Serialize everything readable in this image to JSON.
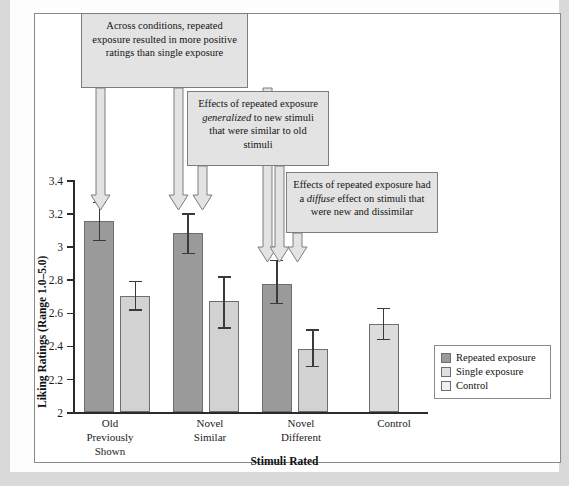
{
  "chart_data": {
    "type": "bar",
    "title": "",
    "xlabel": "Stimuli Rated",
    "ylabel": "Liking Ratings (Range 1.0–5.0)",
    "ylim": [
      2,
      3.4
    ],
    "yticks": [
      "2",
      "2.2",
      "2.4",
      "2.6",
      "2.8",
      "3",
      "3.2",
      "3.4"
    ],
    "ytick_values": [
      2,
      2.2,
      2.4,
      2.6,
      2.8,
      3.0,
      3.2,
      3.4
    ],
    "grid": false,
    "legend_position": "bottom-right",
    "categories": [
      "Old Previously Shown",
      "Novel Similar",
      "Novel Different",
      "Control"
    ],
    "category_lines": [
      [
        "Old",
        "Previously",
        "Shown"
      ],
      [
        "Novel",
        "Similar"
      ],
      [
        "Novel",
        "Different"
      ],
      [
        "Control"
      ]
    ],
    "series": [
      {
        "name": "Repeated exposure",
        "color": "#9a9a9a",
        "values": [
          3.15,
          3.08,
          2.77,
          null
        ],
        "err_low": [
          3.04,
          2.96,
          2.66,
          null
        ],
        "err_high": [
          3.27,
          3.2,
          2.92,
          null
        ]
      },
      {
        "name": "Single exposure",
        "color": "#d2d2d2",
        "values": [
          2.7,
          2.67,
          2.38,
          null
        ],
        "err_low": [
          2.62,
          2.51,
          2.28,
          null
        ],
        "err_high": [
          2.79,
          2.82,
          2.5,
          null
        ]
      },
      {
        "name": "Control",
        "color": "#dcdcdc",
        "values": [
          null,
          null,
          null,
          2.53
        ],
        "err_low": [
          null,
          null,
          null,
          2.44
        ],
        "err_high": [
          null,
          null,
          null,
          2.63
        ]
      }
    ]
  },
  "legend": {
    "items": [
      {
        "label": "Repeated exposure",
        "swatch": "repeated"
      },
      {
        "label": "Single exposure",
        "swatch": "single"
      },
      {
        "label": "Control",
        "swatch": "control"
      }
    ]
  },
  "callouts": [
    {
      "id": "callout-1",
      "text": "Across conditions, repeated exposure resulted in more positive ratings than single exposure"
    },
    {
      "id": "callout-2",
      "text": "Effects of repeated exposure generalized to new stimuli that were similar to old stimuli",
      "emphasis": "generalized"
    },
    {
      "id": "callout-3",
      "text": "Effects of repeated exposure had a diffuse effect on stimuli that were new and dissimilar",
      "emphasis": "diffuse"
    }
  ]
}
